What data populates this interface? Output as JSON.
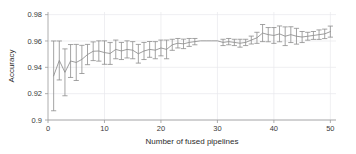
{
  "chart_data": {
    "type": "line",
    "title": "",
    "subtitle": "",
    "xlabel": "Number of fused pipelines",
    "ylabel": "Accuracy",
    "xlim": [
      0,
      51
    ],
    "ylim": [
      0.9,
      0.982
    ],
    "grid": true,
    "legend": null,
    "legend_position": "none",
    "error_bars": "symmetric vertical error bars (std. dev.) on each point",
    "xticks": [
      0,
      10,
      20,
      30,
      40,
      50
    ],
    "xtick_labels": [
      "0",
      "10",
      "20",
      "30",
      "40",
      "50"
    ],
    "yticks": [
      0.9,
      0.92,
      0.94,
      0.96,
      0.98
    ],
    "ytick_labels": [
      "0.9",
      "0.92",
      "0.94",
      "0.96",
      "0.98"
    ],
    "x": [
      1,
      2,
      3,
      4,
      5,
      6,
      7,
      8,
      9,
      10,
      11,
      12,
      13,
      14,
      15,
      16,
      17,
      18,
      19,
      20,
      21,
      22,
      23,
      24,
      25,
      26,
      27,
      28,
      29,
      30,
      31,
      32,
      33,
      34,
      35,
      36,
      37,
      38,
      39,
      40,
      41,
      42,
      43,
      44,
      45,
      46,
      47,
      48,
      49,
      50
    ],
    "values": [
      0.9335,
      0.9452,
      0.9362,
      0.9448,
      0.9437,
      0.946,
      0.9497,
      0.9522,
      0.9524,
      0.9512,
      0.9505,
      0.9536,
      0.9524,
      0.9536,
      0.953,
      0.9503,
      0.9524,
      0.9536,
      0.953,
      0.9547,
      0.9536,
      0.9571,
      0.9583,
      0.9578,
      0.9589,
      0.9595,
      0.9601,
      0.9601,
      0.9601,
      0.9601,
      0.9589,
      0.9595,
      0.9589,
      0.9583,
      0.9589,
      0.9607,
      0.9624,
      0.966,
      0.9648,
      0.9642,
      0.9654,
      0.9636,
      0.9648,
      0.9636,
      0.963,
      0.9636,
      0.9642,
      0.9648,
      0.9654,
      0.9671
    ],
    "errors": [
      0.0265,
      0.0148,
      0.0178,
      0.0125,
      0.0137,
      0.0107,
      0.0077,
      0.0071,
      0.0077,
      0.0089,
      0.0083,
      0.0071,
      0.0065,
      0.0065,
      0.0065,
      0.0071,
      0.0065,
      0.006,
      0.0065,
      0.006,
      0.0071,
      0.0042,
      0.0036,
      0.0036,
      0.003,
      0.0024,
      0.0,
      0.0,
      0.0,
      0.0,
      0.0024,
      0.0024,
      0.0024,
      0.003,
      0.0024,
      0.003,
      0.0042,
      0.0065,
      0.0054,
      0.006,
      0.006,
      0.0071,
      0.006,
      0.006,
      0.0042,
      0.003,
      0.003,
      0.0036,
      0.0036,
      0.0042
    ]
  },
  "colors": {
    "series": "#8d8d8d",
    "grid": "#e8e8ec",
    "axis": "#9a9a9a",
    "text": "#3a3a3a",
    "background": "#ffffff"
  }
}
